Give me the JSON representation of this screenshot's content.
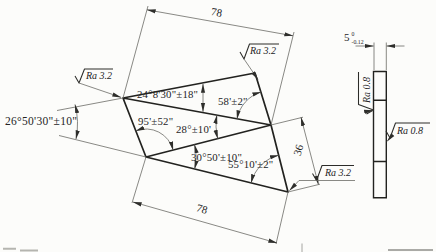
{
  "colors": {
    "ink": "#22221f",
    "thin_line": "#6b6b66",
    "background": "#fcfcfa"
  },
  "front_view": {
    "dims": {
      "top": "78",
      "bottom": "78",
      "right": "36"
    },
    "angles": {
      "at_a_top": "24°8'30\"±18\"",
      "at_c_top": "58'±2\"",
      "at_d_mid": "95'±52\"",
      "at_c_mid": "28°±10'",
      "at_d_bottom": "30°50'±10\"",
      "at_e_bottom": "55°10'±2\"",
      "overall_left": "26°50'30\"±10\""
    },
    "roughness": {
      "top_left": "Ra 3.2",
      "top_right": "Ra 3.2",
      "bottom_right": "Ra 3.2"
    }
  },
  "side_view": {
    "dim_thickness": "5",
    "tol_upper": "0",
    "tol_lower": "-0.12",
    "roughness": {
      "left": "Ra 0.8",
      "right": "Ra 0.8"
    }
  }
}
